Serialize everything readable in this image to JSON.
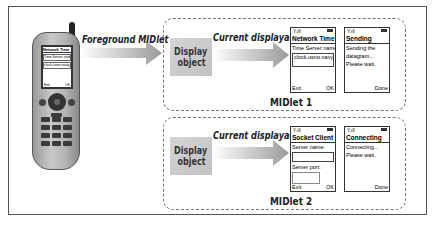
{
  "diagram": {
    "foreground_label": "Foreground MIDlet",
    "phone": {
      "screen_title": "Network Time",
      "screen_lines": [
        "Time Server name:",
        "clock.usno.navy.mil"
      ],
      "soft_left": "Exit",
      "soft_right": "OK"
    },
    "midlets": [
      {
        "name": "MIDlet 1",
        "display_object": [
          "Display",
          "object"
        ],
        "arrow_label": "Current displayable",
        "screens": [
          {
            "title": "Network Time",
            "lines": [
              "Time Server name:"
            ],
            "field": "clock.usno.navy.mil",
            "soft_left": "Exit",
            "soft_right": "OK"
          },
          {
            "title": "Sending",
            "lines": [
              "Sending the",
              "datagram...",
              "Please wait."
            ],
            "soft_left": "",
            "soft_right": "Done"
          }
        ]
      },
      {
        "name": "MIDlet 2",
        "display_object": [
          "Display",
          "object"
        ],
        "arrow_label": "Current displayable",
        "screens": [
          {
            "title": "Socket Client",
            "lines": [
              "Server name:"
            ],
            "field": "",
            "line2": "Server port:",
            "soft_left": "Exit",
            "soft_right": "OK"
          },
          {
            "title": "Connecting",
            "lines": [
              "Connecting...",
              "Please wait."
            ],
            "soft_left": "",
            "soft_right": "Done"
          }
        ]
      }
    ],
    "status_icons": {
      "signal": "Y.ıll",
      "battery": "battery-icon"
    }
  }
}
